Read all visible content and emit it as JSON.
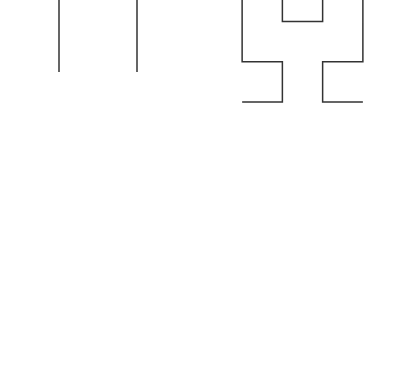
{
  "figure": {
    "canvas": {
      "width": 404,
      "height": 371
    },
    "background_color": "#ffffff",
    "stroke_color": "#333333",
    "stroke_width": 1.5
  },
  "chart_data": {
    "type": "line",
    "xlabel": "",
    "ylabel": "",
    "grid": false,
    "legend": null,
    "layout": {
      "rows": 2,
      "cols": 2,
      "panel_width": 202,
      "panel_height": 185.5
    },
    "series": [
      {
        "name": "Hilbert order 1",
        "order": 1,
        "panel_index": 0,
        "panel_label": "top-left",
        "segments": 3,
        "vertices": 4,
        "cell_size": 132,
        "origin": {
          "x": 20,
          "y": 20
        },
        "note": "Top horizontal connector falls above the visible frame, so only two vertical strokes are rendered"
      },
      {
        "name": "Hilbert order 2",
        "order": 2,
        "panel_index": 1,
        "panel_label": "top-right",
        "segments": 15,
        "vertices": 16,
        "cell_size": 53.67,
        "origin": {
          "x": 222,
          "y": 20
        },
        "note": "Curve is clipped by the top edge of the figure"
      },
      {
        "name": "Hilbert order 3",
        "order": 3,
        "panel_index": 2,
        "panel_label": "bottom-left",
        "segments": 63,
        "vertices": 64,
        "cell_size": 23,
        "origin": {
          "x": 20,
          "y": 200
        },
        "note": "Curve is clipped by the bottom edge of the figure"
      },
      {
        "name": "Hilbert order 4",
        "order": 4,
        "panel_index": 3,
        "panel_label": "bottom-right",
        "segments": 255,
        "vertices": 256,
        "cell_size": 10.7,
        "origin": {
          "x": 222,
          "y": 200
        },
        "note": "Curve is clipped by the bottom edge of the figure"
      }
    ]
  },
  "panels": [
    {
      "name": "panel-order-1",
      "order": 1,
      "left": 0,
      "top": 0,
      "width": 202,
      "height": 186,
      "curve": {
        "x": 20,
        "y": -45,
        "size": 156,
        "translate_y": 0
      }
    },
    {
      "name": "panel-order-2",
      "order": 2,
      "left": 202,
      "top": 0,
      "width": 202,
      "height": 186,
      "curve": {
        "x": 222,
        "y": -39,
        "size": 161,
        "translate_y": 0
      }
    },
    {
      "name": "panel-order-3",
      "order": 3,
      "left": 0,
      "top": 186,
      "width": 202,
      "height": 185,
      "curve": {
        "x": 20,
        "y": 14,
        "size": 161,
        "translate_y": 0
      }
    },
    {
      "name": "panel-order-4",
      "order": 4,
      "left": 202,
      "top": 186,
      "width": 202,
      "height": 185,
      "curve": {
        "x": 222,
        "y": 14,
        "size": 161,
        "translate_y": 0
      }
    }
  ]
}
